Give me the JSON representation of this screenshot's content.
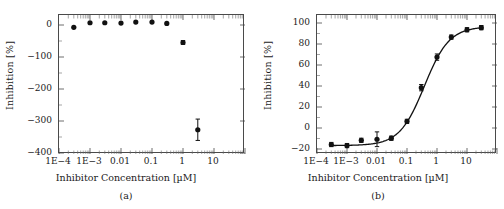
{
  "figure": {
    "background": "#ffffff",
    "marker_color": "#111111",
    "axis_color": "#4a4a4a"
  },
  "panels": [
    {
      "caption": "(a)",
      "xlabel": "Inhibitor Concentration [µM]",
      "ylabel": "Inhibition [%]",
      "xticklabels": [
        "1E−4",
        "1E−3",
        "0.01",
        "0.1",
        "1",
        "10"
      ],
      "yticklabels": [
        "0",
        "−100",
        "−200",
        "−300",
        "−400"
      ]
    },
    {
      "caption": "(b)",
      "xlabel": "Inhibitor Concentration [µM]",
      "ylabel": "Inhibition [%]",
      "xticklabels": [
        "1E−4",
        "1E−3",
        "0.01",
        "0.1",
        "1",
        "10"
      ],
      "yticklabels": [
        "100",
        "80",
        "60",
        "40",
        "20",
        "0",
        "−20"
      ]
    }
  ],
  "chart_data": [
    {
      "type": "scatter",
      "panel": "(a)",
      "title": "",
      "xlabel": "Inhibitor Concentration [µM]",
      "ylabel": "Inhibition [%]",
      "xscale": "log",
      "xlim": [
        0.0001,
        100
      ],
      "ylim": [
        -400,
        30
      ],
      "xticks": [
        0.0001,
        0.001,
        0.01,
        0.1,
        1,
        10
      ],
      "xticklabels": [
        "1E−4",
        "1E−3",
        "0.01",
        "0.1",
        "1",
        "10"
      ],
      "yticks": [
        0,
        -100,
        -200,
        -300,
        -400
      ],
      "yticklabels": [
        "0",
        "−100",
        "−200",
        "−300",
        "−400"
      ],
      "grid": false,
      "legend": "none",
      "x": [
        0.0003,
        0.001,
        0.003,
        0.01,
        0.03,
        0.1,
        0.3,
        1,
        3
      ],
      "y": [
        -8,
        6,
        6,
        5,
        8,
        8,
        4,
        -55,
        -325
      ],
      "yerr": [
        3,
        3,
        3,
        3,
        3,
        3,
        3,
        6,
        33
      ],
      "has_fit_curve": false
    },
    {
      "type": "scatter",
      "panel": "(b)",
      "title": "",
      "xlabel": "Inhibitor Concentration [µM]",
      "ylabel": "Inhibition [%]",
      "xscale": "log",
      "xlim": [
        0.0001,
        100
      ],
      "ylim": [
        -20,
        112
      ],
      "xticks": [
        0.0001,
        0.001,
        0.01,
        0.1,
        1,
        10
      ],
      "xticklabels": [
        "1E−4",
        "1E−3",
        "0.01",
        "0.1",
        "1",
        "10"
      ],
      "yticks": [
        100,
        80,
        60,
        40,
        20,
        0,
        -20
      ],
      "yticklabels": [
        "100",
        "80",
        "60",
        "40",
        "20",
        "0",
        "−20"
      ],
      "grid": false,
      "legend": "none",
      "x": [
        0.0003,
        0.001,
        0.003,
        0.01,
        0.03,
        0.1,
        0.3,
        1,
        3,
        10,
        30
      ],
      "y": [
        -11,
        -12,
        -7,
        -6,
        -5,
        11,
        43,
        72,
        91,
        98,
        100
      ],
      "yerr": [
        2,
        2,
        2,
        7,
        2,
        2,
        3,
        3,
        2,
        2,
        2
      ],
      "has_fit_curve": true,
      "fit": {
        "model": "four-parameter logistic",
        "bottom": -12,
        "top": 101,
        "ic50": 0.38,
        "hill_slope": 1.05
      }
    }
  ]
}
